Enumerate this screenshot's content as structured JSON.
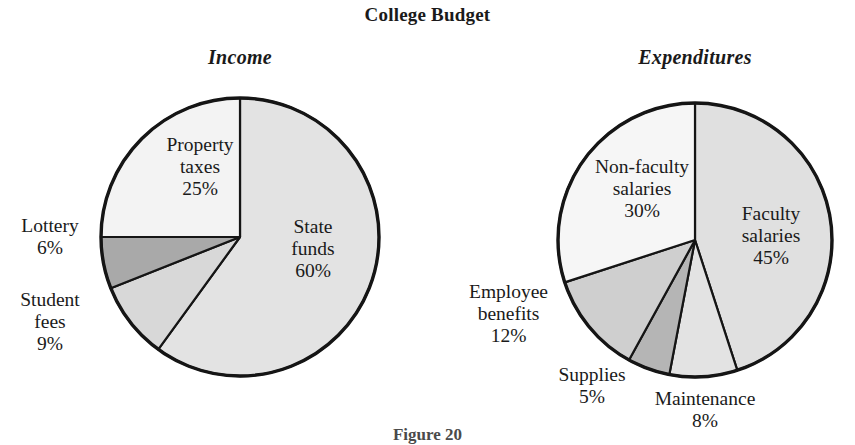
{
  "chart_data": [
    {
      "type": "pie",
      "title": "Income",
      "categories": [
        "State funds",
        "Student fees",
        "Lottery",
        "Property taxes"
      ],
      "values": [
        60,
        9,
        6,
        25
      ],
      "value_labels": [
        "60%",
        "9%",
        "6%",
        "25%"
      ],
      "unit": "%",
      "start_angle_deg": 0,
      "direction": "clockwise",
      "legend": "none",
      "grid": false,
      "slice_colors": [
        "#e3e3e3",
        "#d8d8d8",
        "#a9a9a9",
        "#f3f3f3"
      ]
    },
    {
      "type": "pie",
      "title": "Expenditures",
      "categories": [
        "Faculty salaries",
        "Maintenance",
        "Supplies",
        "Employee benefits",
        "Non-faculty salaries"
      ],
      "values": [
        45,
        8,
        5,
        12,
        30
      ],
      "value_labels": [
        "45%",
        "8%",
        "5%",
        "12%",
        "30%"
      ],
      "unit": "%",
      "start_angle_deg": 0,
      "direction": "clockwise",
      "legend": "none",
      "grid": false,
      "slice_colors": [
        "#e0e0e0",
        "#e3e3e3",
        "#b5b5b5",
        "#cfcfcf",
        "#f6f6f6"
      ]
    }
  ],
  "figure": {
    "title": "College Budget",
    "caption": "Figure 20"
  },
  "panels": {
    "income": {
      "title": "Income",
      "labels": {
        "property_taxes": {
          "line1": "Property",
          "line2": "taxes",
          "value": "25%"
        },
        "state_funds": {
          "line1": "State",
          "line2": "funds",
          "value": "60%"
        },
        "lottery": {
          "line1": "Lottery",
          "value": "6%"
        },
        "student_fees": {
          "line1": "Student",
          "line2": "fees",
          "value": "9%"
        }
      }
    },
    "expenditures": {
      "title": "Expenditures",
      "labels": {
        "non_faculty_salaries": {
          "line1": "Non-faculty",
          "line2": "salaries",
          "value": "30%"
        },
        "faculty_salaries": {
          "line1": "Faculty",
          "line2": "salaries",
          "value": "45%"
        },
        "employee_benefits": {
          "line1": "Employee",
          "line2": "benefits",
          "value": "12%"
        },
        "supplies": {
          "line1": "Supplies",
          "value": "5%"
        },
        "maintenance": {
          "line1": "Maintenance",
          "value": "8%"
        }
      }
    }
  },
  "colors": {
    "outline": "#151515",
    "text": "#1a1a1a",
    "background": "#ffffff",
    "gray_lightest": "#f6f6f6",
    "gray_light": "#e3e3e3",
    "gray_mid": "#cfcfcf",
    "gray_dark": "#a9a9a9"
  }
}
